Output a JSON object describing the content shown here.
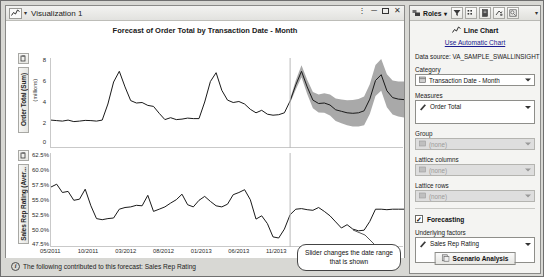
{
  "window": {
    "title": "Visualization 1",
    "icon": "line-chart-icon",
    "controls": [
      "pin",
      "minimize",
      "maximize",
      "close"
    ]
  },
  "chart": {
    "title": "Forecast of Order Total by Transaction Date - Month",
    "top_axis_label": "Order Total (Sum)",
    "top_axis_units": "(millions)",
    "bottom_axis_label": "Sales Rep Rating (Aver...",
    "x_axis_button": "Transaction Date - Month",
    "callout": "Slider changes the date range that is shown",
    "status": "The following contributed to this forecast: Sales Rep Rating",
    "status_icon": "info-icon"
  },
  "chart_data": {
    "type": "line",
    "title": "Forecast of Order Total by Transaction Date - Month",
    "xlabel": "Transaction Date - Month",
    "xticks": [
      "05/2011",
      "10/2011",
      "03/2012",
      "08/2012",
      "01/2013",
      "06/2013",
      "11/2013",
      "04/2014",
      "09/2014",
      "02/2015"
    ],
    "forecast_start": "11/2013",
    "panels": [
      {
        "name": "order-total-panel",
        "ylabel": "Order Total (Sum)",
        "yunits": "(millions)",
        "yticks": [
          8,
          6,
          4,
          2,
          0
        ],
        "ylim": [
          0,
          8.6
        ],
        "grid": false,
        "series": [
          {
            "name": "Order Total",
            "type": "line",
            "color": "#1a1a1a",
            "values": [
              2.55,
              2.5,
              2.45,
              2.55,
              2.4,
              2.45,
              2.52,
              2.5,
              2.45,
              2.55,
              4.2,
              6.45,
              7.55,
              5.95,
              4.55,
              4.3,
              4.35,
              4.05,
              3.95,
              3.25,
              2.6,
              2.8,
              2.6,
              2.65,
              2.75,
              2.7,
              2.7,
              4.4,
              6.5,
              7.4,
              5.6,
              4.6,
              4.35,
              4.45,
              4.2,
              3.65,
              3.3,
              3.55,
              3.15,
              3.05,
              3.1,
              3.3,
              4.5,
              6.15,
              7.55,
              5.95,
              4.6,
              4.25,
              4.3,
              4.1,
              3.6,
              3.45,
              3.3,
              3.25,
              3.3,
              3.5,
              4.7,
              6.6,
              7.2,
              5.55,
              4.85,
              4.7,
              4.65
            ]
          },
          {
            "name": "Confidence band",
            "type": "band",
            "color": "#a9a9a9",
            "starts_at_index": 42
          }
        ]
      },
      {
        "name": "sales-rep-rating-panel",
        "ylabel": "Sales Rep Rating (Aver...",
        "yticks": [
          "62.5%",
          "60.0%",
          "57.5%",
          "55.0%",
          "52.5%",
          "50.0%",
          "47.5%"
        ],
        "ylim": [
          47.5,
          63.0
        ],
        "grid": false,
        "series": [
          {
            "name": "Sales Rep Rating",
            "type": "line",
            "color": "#1a1a1a",
            "values": [
              57.6,
              58.1,
              56.6,
              56.8,
              55.2,
              55.4,
              57.2,
              54.2,
              51.9,
              51.7,
              51.9,
              52.0,
              53.6,
              53.9,
              54.0,
              54.3,
              54.2,
              56.1,
              53.2,
              53.6,
              54.0,
              54.7,
              55.3,
              56.3,
              54.4,
              54.0,
              55.2,
              55.9,
              55.0,
              54.2,
              54.0,
              54.5,
              56.2,
              56.6,
              57.1,
              55.3,
              51.8,
              52.4,
              51.0,
              48.6,
              48.4,
              50.0,
              52.6,
              53.6,
              53.7,
              53.5,
              53.4,
              53.9,
              53.2,
              52.4,
              51.3,
              50.2,
              50.8,
              50.0,
              49.7,
              49.8,
              51.4,
              53.6,
              53.6,
              53.5,
              53.6,
              53.6,
              53.6
            ]
          }
        ]
      }
    ]
  },
  "roles_panel": {
    "toolbar_label": "Roles",
    "toolbar_icons": [
      "roles-icon",
      "filter-icon",
      "ranks-icon",
      "properties-icon",
      "display-rules-icon",
      "preview-icon"
    ],
    "overflow": "▾",
    "chart_type": "Line Chart",
    "chart_type_icon": "line-chart-icon",
    "auto_chart_link": "Use Automatic Chart",
    "data_source_label": "Data source:",
    "data_source_value": "VA_SAMPLE_SWALLINSIGHT",
    "fields": [
      {
        "label": "Category",
        "value": "Transaction Date - Month",
        "icon": "date-icon",
        "disabled": false,
        "type": "combo"
      },
      {
        "label": "Measures",
        "value": "Order Total",
        "icon": "measure-icon",
        "disabled": false,
        "type": "listbox"
      },
      {
        "label": "Group",
        "value": "(none)",
        "icon": "category-icon",
        "disabled": true,
        "type": "combo"
      },
      {
        "label": "Lattice columns",
        "value": "(none)",
        "icon": "category-icon",
        "disabled": true,
        "type": "combo"
      },
      {
        "label": "Lattice rows",
        "value": "(none)",
        "icon": "category-icon",
        "disabled": true,
        "type": "combo"
      }
    ],
    "forecasting_label": "Forecasting",
    "forecasting_checked": true,
    "underlying_label": "Underlying factors",
    "underlying_value": "Sales Rep Rating",
    "underlying_icon": "measure-icon",
    "scenario_button": "Scenario Analysis",
    "scenario_icon": "scenario-icon"
  },
  "colors": {
    "line": "#1a1a1a",
    "band": "#a9a9a9",
    "link": "#1b1b8f",
    "panel_bg": "#f4f4f2",
    "window_bg": "#d8d8d4"
  }
}
